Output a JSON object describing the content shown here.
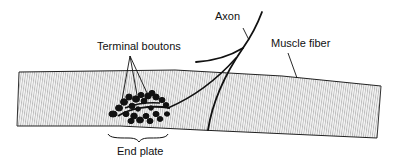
{
  "diagram": {
    "type": "anatomical-illustration",
    "labels": {
      "terminal_boutons": "Terminal boutons",
      "axon": "Axon",
      "muscle_fiber": "Muscle fiber",
      "end_plate": "End plate"
    },
    "colors": {
      "stroke": "#111111",
      "hatch": "#9a9a9a",
      "fill": "#f4f4f4",
      "background": "#ffffff"
    }
  }
}
